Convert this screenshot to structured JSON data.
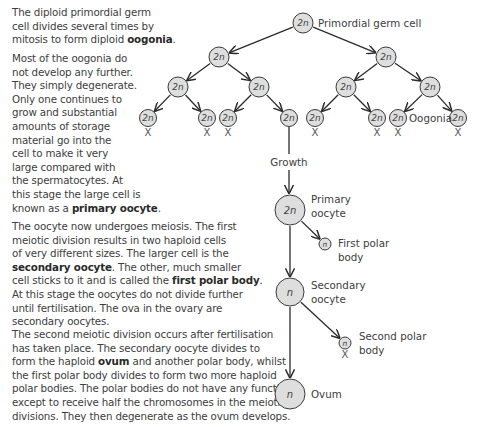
{
  "paragraphs": [
    {
      "id": "p1",
      "top": 6,
      "lines": [
        [
          {
            "t": "The diploid primordial germ"
          }
        ],
        [
          {
            "t": "cell divides several times by"
          }
        ],
        [
          {
            "t": "mitosis to form diploid "
          },
          {
            "t": "oogonia",
            "b": true
          },
          {
            "t": "."
          }
        ]
      ]
    },
    {
      "id": "p2",
      "top": 52,
      "lines": [
        [
          {
            "t": "Most of the oogonia do"
          }
        ],
        [
          {
            "t": "not develop any further."
          }
        ],
        [
          {
            "t": "They simply degenerate."
          }
        ],
        [
          {
            "t": "Only one continues to"
          }
        ],
        [
          {
            "t": "grow and substantial"
          }
        ],
        [
          {
            "t": "amounts of storage"
          }
        ],
        [
          {
            "t": "material go into the"
          }
        ],
        [
          {
            "t": "cell to make it very"
          }
        ],
        [
          {
            "t": "large compared with"
          }
        ],
        [
          {
            "t": "the spermatocytes. At"
          }
        ],
        [
          {
            "t": "this stage the large cell is"
          }
        ],
        [
          {
            "t": "known as a "
          },
          {
            "t": "primary oocyte",
            "b": true
          },
          {
            "t": "."
          }
        ]
      ]
    },
    {
      "id": "p3",
      "top": 220,
      "lines": [
        [
          {
            "t": "The oocyte now undergoes meiosis. The first"
          }
        ],
        [
          {
            "t": "meiotic division results in two haploid cells"
          }
        ],
        [
          {
            "t": "of very different sizes. The larger cell is the"
          }
        ],
        [
          {
            "t": "secondary oocyte",
            "b": true
          },
          {
            "t": ". The other, much smaller"
          }
        ],
        [
          {
            "t": "cell sticks to it and is called the "
          },
          {
            "t": "first polar body",
            "b": true
          },
          {
            "t": "."
          }
        ],
        [
          {
            "t": "At this stage the oocytes do not divide further"
          }
        ],
        [
          {
            "t": "until fertilisation. The ova in the ovary are"
          }
        ],
        [
          {
            "t": "secondary oocytes."
          }
        ]
      ]
    },
    {
      "id": "p4",
      "top": 328,
      "lines": [
        [
          {
            "t": "The second meiotic division occurs after fertilisation"
          }
        ],
        [
          {
            "t": "has taken place. The secondary oocyte divides to"
          }
        ],
        [
          {
            "t": "form the haploid "
          },
          {
            "t": "ovum",
            "b": true
          },
          {
            "t": " and another polar body, whilst"
          }
        ],
        [
          {
            "t": "the first polar body divides to form two more haploid"
          }
        ],
        [
          {
            "t": "polar bodies. The polar bodies do not have any function"
          }
        ],
        [
          {
            "t": "except to receive half the chromosomes in the meiotic"
          }
        ],
        [
          {
            "t": "divisions. They then degenerate as the ovum develops."
          }
        ]
      ]
    }
  ],
  "diagram": {
    "colors": {
      "cell_fill": "#dedede",
      "cell_stroke": "#3a3a3a",
      "arrow": "#2b2b2b",
      "text": "#3d3d3d"
    },
    "labels": {
      "primordial": "Primordial germ cell",
      "oogonia": "Oogonia",
      "growth": "Growth",
      "primary_1": "Primary",
      "primary_2": "oocyte",
      "first_polar_1": "First polar",
      "first_polar_2": "body",
      "secondary_1": "Secondary",
      "secondary_2": "oocyte",
      "second_polar_1": "Second polar",
      "second_polar_2": "body",
      "ovum": "Ovum",
      "degenerate_mark": "X"
    },
    "nodes": [
      {
        "id": "root",
        "x": 303,
        "y": 23,
        "r": 10,
        "label": "2n"
      },
      {
        "id": "l2a",
        "x": 219,
        "y": 57,
        "r": 10,
        "label": "2n"
      },
      {
        "id": "l2b",
        "x": 386,
        "y": 57,
        "r": 10,
        "label": "2n"
      },
      {
        "id": "l3a",
        "x": 178,
        "y": 87,
        "r": 10,
        "label": "2n"
      },
      {
        "id": "l3b",
        "x": 259,
        "y": 87,
        "r": 10,
        "label": "2n"
      },
      {
        "id": "l3c",
        "x": 346,
        "y": 87,
        "r": 10,
        "label": "2n"
      },
      {
        "id": "l3d",
        "x": 430,
        "y": 87,
        "r": 10,
        "label": "2n"
      },
      {
        "id": "o1",
        "x": 148,
        "y": 118,
        "r": 8.5,
        "label": "2n",
        "x_mark": true
      },
      {
        "id": "o2",
        "x": 207,
        "y": 118,
        "r": 8.5,
        "label": "2n",
        "x_mark": true
      },
      {
        "id": "o3",
        "x": 228,
        "y": 118,
        "r": 8.5,
        "label": "2n",
        "x_mark": true
      },
      {
        "id": "o4",
        "x": 289,
        "y": 118,
        "r": 8.5,
        "label": "2n",
        "x_mark": false
      },
      {
        "id": "o5",
        "x": 315,
        "y": 118,
        "r": 8.5,
        "label": "2n",
        "x_mark": true
      },
      {
        "id": "o6",
        "x": 377,
        "y": 118,
        "r": 8.5,
        "label": "2n",
        "x_mark": true
      },
      {
        "id": "o7",
        "x": 398,
        "y": 118,
        "r": 8.5,
        "label": "2n",
        "x_mark": true
      },
      {
        "id": "o8",
        "x": 458,
        "y": 118,
        "r": 8.5,
        "label": "2n",
        "x_mark": true
      },
      {
        "id": "primary",
        "x": 290,
        "y": 210,
        "r": 15,
        "label": "2n"
      },
      {
        "id": "firstpolar",
        "x": 325,
        "y": 244,
        "r": 6,
        "label": "n"
      },
      {
        "id": "secondary",
        "x": 290,
        "y": 292,
        "r": 14,
        "label": "n"
      },
      {
        "id": "secondpolar",
        "x": 345,
        "y": 343,
        "r": 6,
        "label": "n",
        "x_mark": true
      },
      {
        "id": "ovum",
        "x": 290,
        "y": 394,
        "r": 15,
        "label": "n"
      }
    ],
    "edges": [
      [
        "root",
        "l2a"
      ],
      [
        "root",
        "l2b"
      ],
      [
        "l2a",
        "l3a"
      ],
      [
        "l2a",
        "l3b"
      ],
      [
        "l2b",
        "l3c"
      ],
      [
        "l2b",
        "l3d"
      ],
      [
        "l3a",
        "o1"
      ],
      [
        "l3a",
        "o2"
      ],
      [
        "l3b",
        "o3"
      ],
      [
        "l3b",
        "o4"
      ],
      [
        "l3c",
        "o5"
      ],
      [
        "l3c",
        "o6"
      ],
      [
        "l3d",
        "o7"
      ],
      [
        "l3d",
        "o8"
      ],
      [
        "primary",
        "firstpolar"
      ],
      [
        "primary",
        "secondary"
      ],
      [
        "secondary",
        "secondpolar"
      ],
      [
        "secondary",
        "ovum"
      ]
    ]
  }
}
